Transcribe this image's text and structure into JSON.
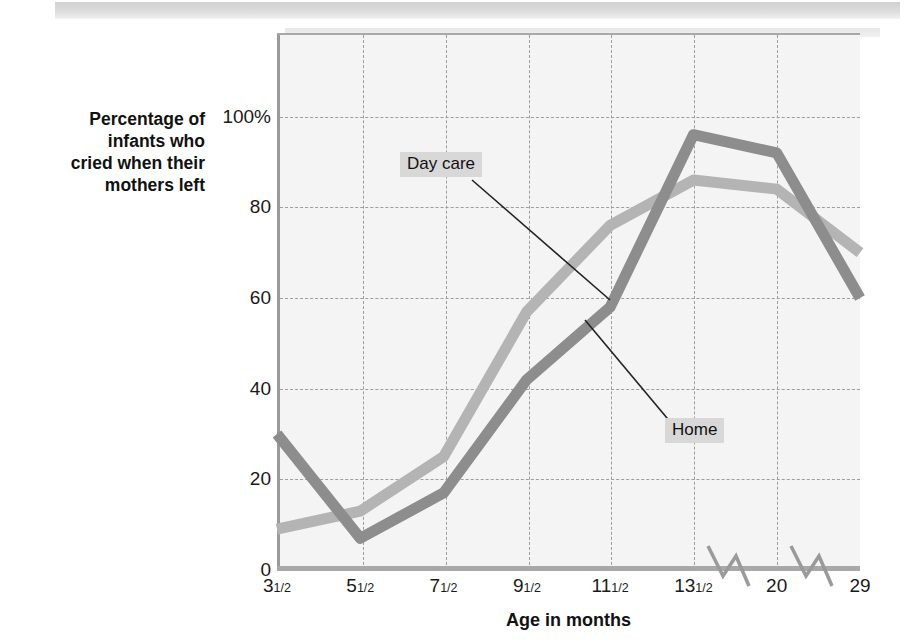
{
  "chart_data": {
    "type": "line",
    "title": "",
    "xlabel": "Age in months",
    "ylabel": "Percentage of infants who cried when their mothers left",
    "ylabel_lines": [
      "Percentage of",
      "infants who",
      "cried when their",
      "mothers left"
    ],
    "categories": [
      "3½",
      "5½",
      "7½",
      "9½",
      "11½",
      "13½",
      "20",
      "29"
    ],
    "category_parts": [
      {
        "whole": "3",
        "frac": "1/2"
      },
      {
        "whole": "5",
        "frac": "1/2"
      },
      {
        "whole": "7",
        "frac": "1/2"
      },
      {
        "whole": "9",
        "frac": "1/2"
      },
      {
        "whole": "11",
        "frac": "1/2"
      },
      {
        "whole": "13",
        "frac": "1/2"
      },
      {
        "whole": "20",
        "frac": ""
      },
      {
        "whole": "29",
        "frac": ""
      }
    ],
    "ylim": [
      0,
      118
    ],
    "yticks": [
      0,
      20,
      40,
      60,
      80,
      100
    ],
    "ytick_labels": [
      "0",
      "20",
      "40",
      "60",
      "80",
      "100%"
    ],
    "grid": true,
    "legend": "inline-annotations",
    "axis_breaks": [
      "between 13½ and 20",
      "between 20 and 29"
    ],
    "series": [
      {
        "name": "Day care",
        "color": "#b4b4b4",
        "values": [
          9,
          13,
          25,
          57,
          76,
          86,
          84,
          70
        ]
      },
      {
        "name": "Home",
        "color": "#8d8d8d",
        "values": [
          30,
          7,
          17,
          42,
          58,
          96,
          92,
          60
        ]
      }
    ],
    "annotations": [
      {
        "text": "Day care",
        "target_series": "Day care"
      },
      {
        "text": "Home",
        "target_series": "Home"
      }
    ]
  },
  "colors": {
    "plot_background": "#f4f4f4",
    "gridline": "#9d9d9d",
    "axis": "#9a9a9a",
    "label_background": "#d8d8d8",
    "text": "#1a1a1a"
  }
}
